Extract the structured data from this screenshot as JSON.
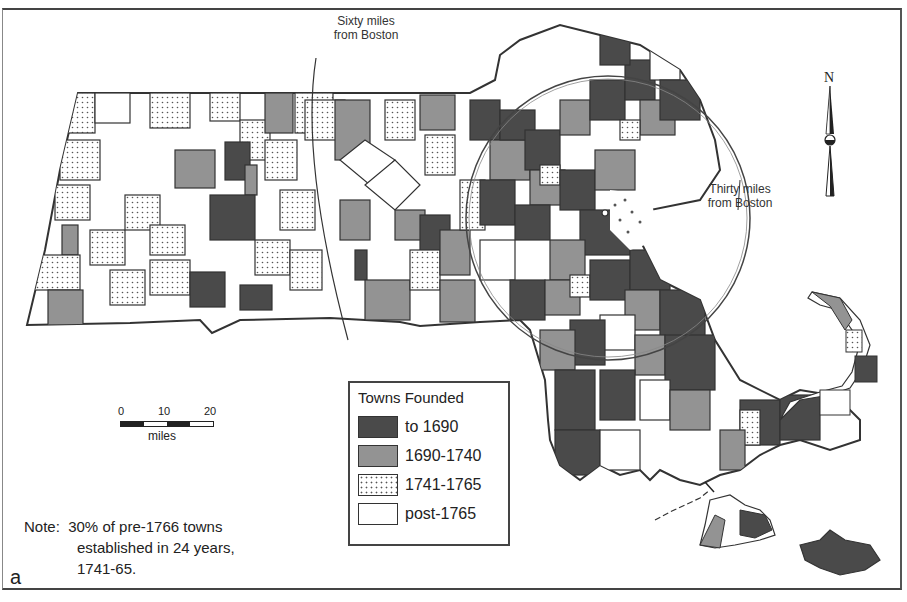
{
  "figure": {
    "panel_letter": "a",
    "type": "choropleth map of Massachusetts towns by founding date"
  },
  "annotations": {
    "sixty_miles_line1": "Sixty miles",
    "sixty_miles_line2": "from Boston",
    "thirty_miles_line1": "Thirty miles",
    "thirty_miles_line2": "from Boston"
  },
  "north_arrow": {
    "label": "N",
    "icon": "north-arrow-icon"
  },
  "scale_bar": {
    "ticks": [
      "0",
      "10",
      "20"
    ],
    "units": "miles"
  },
  "legend": {
    "title": "Towns Founded",
    "items": [
      {
        "label": "to 1690",
        "fill": "#4a4a4a",
        "pattern": "solid-dark"
      },
      {
        "label": "1690-1740",
        "fill": "#939393",
        "pattern": "solid-mid"
      },
      {
        "label": "1741-1765",
        "fill": "#ffffff",
        "pattern": "dotted"
      },
      {
        "label": "post-1765",
        "fill": "#ffffff",
        "pattern": "blank"
      }
    ]
  },
  "note": {
    "line1": "Note:  30% of pre-1766 towns",
    "line2": "established in 24 years,",
    "line3": "1741-65."
  },
  "colors": {
    "to_1690": "#4a4a4a",
    "1690_1740": "#939393",
    "border": "#333333",
    "background": "#ffffff"
  }
}
